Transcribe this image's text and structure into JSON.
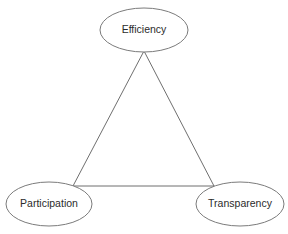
{
  "diagram": {
    "type": "triangle-relationship-diagram",
    "background_color": "#ffffff",
    "node_fill_color": "#ffffff",
    "node_stroke_color": "#7b7b7b",
    "edge_color": "#6f6f6f",
    "label_color": "#2b2b2b",
    "nodes": [
      {
        "id": "efficiency",
        "label": "Efficiency",
        "cx": 144,
        "cy": 30,
        "rx": 44,
        "ry": 22
      },
      {
        "id": "participation",
        "label": "Participation",
        "cx": 49,
        "cy": 204,
        "rx": 43,
        "ry": 22
      },
      {
        "id": "transparency",
        "label": "Transparency",
        "cx": 240,
        "cy": 204,
        "rx": 44,
        "ry": 22
      }
    ],
    "edges": [
      {
        "id": "efficiency-participation",
        "from": "efficiency",
        "to": "participation",
        "x1": 144,
        "y1": 51,
        "x2": 73,
        "y2": 186
      },
      {
        "id": "efficiency-transparency",
        "from": "efficiency",
        "to": "transparency",
        "x1": 144,
        "y1": 51,
        "x2": 214,
        "y2": 186
      },
      {
        "id": "participation-transparency",
        "from": "participation",
        "to": "transparency",
        "x1": 73,
        "y1": 186,
        "x2": 214,
        "y2": 186
      }
    ]
  }
}
